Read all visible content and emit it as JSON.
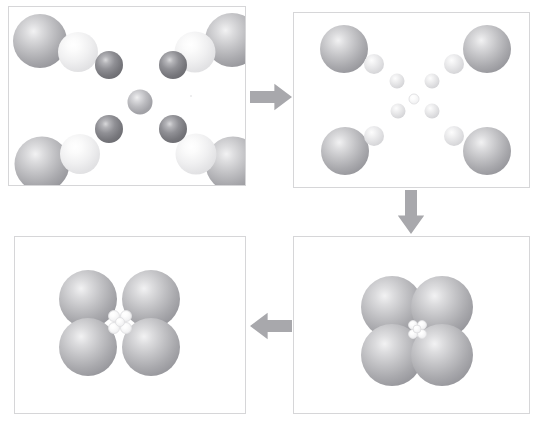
{
  "figure": {
    "background_color": "#ffffff",
    "panel_border_color": "#d6d6d8",
    "arrow_color": "#a8a8ac",
    "width": 538,
    "height": 427
  },
  "colors": {
    "large_sphere": "#a9a9ad",
    "pale_sphere": "#e3e3e5",
    "dark_sphere": "#77777c",
    "mid_sphere": "#bcbcc0",
    "tiny_sphere": "#f4f4f5",
    "ring_sphere": "#d2d2d5",
    "arrow": "#a8a8ac",
    "border": "#d6d6d8"
  },
  "panels": [
    {
      "id": "panel-1",
      "name": "expanded-lattice",
      "label": "",
      "order": 1,
      "rect": {
        "x": 8,
        "y": 6,
        "width": 238,
        "height": 180
      },
      "spheres": [
        {
          "name": "corner-large-top-left",
          "kind": "large",
          "cx": 31,
          "cy": 34,
          "d": 54
        },
        {
          "name": "corner-pale-top-left",
          "kind": "pale",
          "cx": 69,
          "cy": 45,
          "d": 40
        },
        {
          "name": "corner-large-top-right",
          "kind": "large",
          "cx": 223,
          "cy": 33,
          "d": 54
        },
        {
          "name": "corner-pale-top-right",
          "kind": "pale",
          "cx": 186,
          "cy": 45,
          "d": 41
        },
        {
          "name": "corner-large-bottom-left",
          "kind": "large",
          "cx": 33,
          "cy": 157,
          "d": 55
        },
        {
          "name": "corner-pale-bottom-left",
          "kind": "pale",
          "cx": 71,
          "cy": 147,
          "d": 40
        },
        {
          "name": "corner-large-bottom-right",
          "kind": "large",
          "cx": 224,
          "cy": 157,
          "d": 55
        },
        {
          "name": "corner-pale-bottom-right",
          "kind": "pale",
          "cx": 187,
          "cy": 147,
          "d": 41
        },
        {
          "name": "inner-dark-top-left",
          "kind": "dark",
          "cx": 100,
          "cy": 58,
          "d": 28
        },
        {
          "name": "inner-dark-top-right",
          "kind": "dark",
          "cx": 164,
          "cy": 58,
          "d": 28
        },
        {
          "name": "inner-dark-bottom-left",
          "kind": "dark",
          "cx": 100,
          "cy": 122,
          "d": 28
        },
        {
          "name": "inner-dark-bottom-right",
          "kind": "dark",
          "cx": 164,
          "cy": 122,
          "d": 28
        },
        {
          "name": "inner-centre",
          "kind": "mid",
          "cx": 131,
          "cy": 95,
          "d": 25
        }
      ]
    },
    {
      "id": "panel-2",
      "name": "partially-compressed-lattice",
      "label": "",
      "order": 2,
      "rect": {
        "x": 293,
        "y": 12,
        "width": 237,
        "height": 176
      },
      "spheres": [
        {
          "name": "corner-large-top-left",
          "kind": "large",
          "cx": 50,
          "cy": 36,
          "d": 48
        },
        {
          "name": "corner-ring-top-left",
          "kind": "ring",
          "cx": 80,
          "cy": 51,
          "d": 20
        },
        {
          "name": "corner-large-top-right",
          "kind": "large",
          "cx": 193,
          "cy": 36,
          "d": 48
        },
        {
          "name": "corner-ring-top-right",
          "kind": "ring",
          "cx": 160,
          "cy": 51,
          "d": 20
        },
        {
          "name": "corner-large-bottom-left",
          "kind": "large",
          "cx": 51,
          "cy": 138,
          "d": 48
        },
        {
          "name": "corner-ring-bottom-left",
          "kind": "ring",
          "cx": 80,
          "cy": 123,
          "d": 20
        },
        {
          "name": "corner-large-bottom-right",
          "kind": "large",
          "cx": 193,
          "cy": 138,
          "d": 48
        },
        {
          "name": "corner-ring-bottom-right",
          "kind": "ring",
          "cx": 160,
          "cy": 123,
          "d": 20
        },
        {
          "name": "inner-ring-top-left",
          "kind": "ring",
          "cx": 103,
          "cy": 68,
          "d": 15
        },
        {
          "name": "inner-ring-top-right",
          "kind": "ring",
          "cx": 138,
          "cy": 68,
          "d": 15
        },
        {
          "name": "inner-ring-bottom-left",
          "kind": "ring",
          "cx": 104,
          "cy": 98,
          "d": 15
        },
        {
          "name": "inner-ring-bottom-right",
          "kind": "ring",
          "cx": 138,
          "cy": 98,
          "d": 15
        },
        {
          "name": "inner-centre",
          "kind": "tiny",
          "cx": 120,
          "cy": 86,
          "d": 11
        }
      ]
    },
    {
      "id": "panel-3",
      "name": "fully-compressed-cluster",
      "label": "",
      "order": 3,
      "rect": {
        "x": 293,
        "y": 236,
        "width": 237,
        "height": 178
      },
      "spheres": [
        {
          "name": "cluster-large-top-left",
          "kind": "large",
          "cx": 98,
          "cy": 70,
          "d": 62
        },
        {
          "name": "cluster-large-top-right",
          "kind": "large",
          "cx": 148,
          "cy": 70,
          "d": 62
        },
        {
          "name": "cluster-large-bottom-left",
          "kind": "large",
          "cx": 98,
          "cy": 118,
          "d": 62
        },
        {
          "name": "cluster-large-bottom-right",
          "kind": "large",
          "cx": 148,
          "cy": 118,
          "d": 62
        },
        {
          "name": "interstitial-top-left",
          "kind": "tiny",
          "cx": 119,
          "cy": 88,
          "d": 10
        },
        {
          "name": "interstitial-top-right",
          "kind": "tiny",
          "cx": 128,
          "cy": 88,
          "d": 10
        },
        {
          "name": "interstitial-bottom-left",
          "kind": "tiny",
          "cx": 119,
          "cy": 97,
          "d": 10
        },
        {
          "name": "interstitial-bottom-right",
          "kind": "tiny",
          "cx": 128,
          "cy": 97,
          "d": 10
        },
        {
          "name": "interstitial-centre",
          "kind": "tiny",
          "cx": 123,
          "cy": 92,
          "d": 9
        }
      ]
    },
    {
      "id": "panel-4",
      "name": "relaxed-cluster",
      "label": "",
      "order": 4,
      "rect": {
        "x": 14,
        "y": 236,
        "width": 232,
        "height": 178
      },
      "spheres": [
        {
          "name": "cluster-large-top-left",
          "kind": "large",
          "cx": 73,
          "cy": 62,
          "d": 58
        },
        {
          "name": "cluster-large-top-right",
          "kind": "large",
          "cx": 136,
          "cy": 62,
          "d": 58
        },
        {
          "name": "cluster-large-bottom-left",
          "kind": "large",
          "cx": 73,
          "cy": 110,
          "d": 58
        },
        {
          "name": "cluster-large-bottom-right",
          "kind": "large",
          "cx": 136,
          "cy": 110,
          "d": 58
        },
        {
          "name": "interstitial-top-left",
          "kind": "tiny",
          "cx": 99,
          "cy": 79,
          "d": 12
        },
        {
          "name": "interstitial-top-right",
          "kind": "tiny",
          "cx": 111,
          "cy": 79,
          "d": 12
        },
        {
          "name": "interstitial-bottom-left",
          "kind": "tiny",
          "cx": 99,
          "cy": 91,
          "d": 12
        },
        {
          "name": "interstitial-bottom-right",
          "kind": "tiny",
          "cx": 111,
          "cy": 91,
          "d": 12
        },
        {
          "name": "interstitial-centre",
          "kind": "tiny",
          "cx": 105,
          "cy": 85,
          "d": 10
        }
      ]
    }
  ],
  "arrows": [
    {
      "id": "arrow-1",
      "name": "arrow-right-panel1-to-panel2",
      "direction": "right",
      "from": "panel-1",
      "to": "panel-2",
      "rect": {
        "x": 250,
        "y": 82,
        "width": 42,
        "height": 30
      }
    },
    {
      "id": "arrow-2",
      "name": "arrow-down-panel2-to-panel3",
      "direction": "down",
      "from": "panel-2",
      "to": "panel-3",
      "rect": {
        "x": 396,
        "y": 190,
        "width": 30,
        "height": 44
      }
    },
    {
      "id": "arrow-3",
      "name": "arrow-left-panel3-to-panel4",
      "direction": "left",
      "from": "panel-3",
      "to": "panel-4",
      "rect": {
        "x": 250,
        "y": 311,
        "width": 42,
        "height": 30
      }
    }
  ],
  "artifacts": [
    {
      "name": "speck-panel1",
      "x": 190,
      "y": 95,
      "size": 2
    }
  ]
}
